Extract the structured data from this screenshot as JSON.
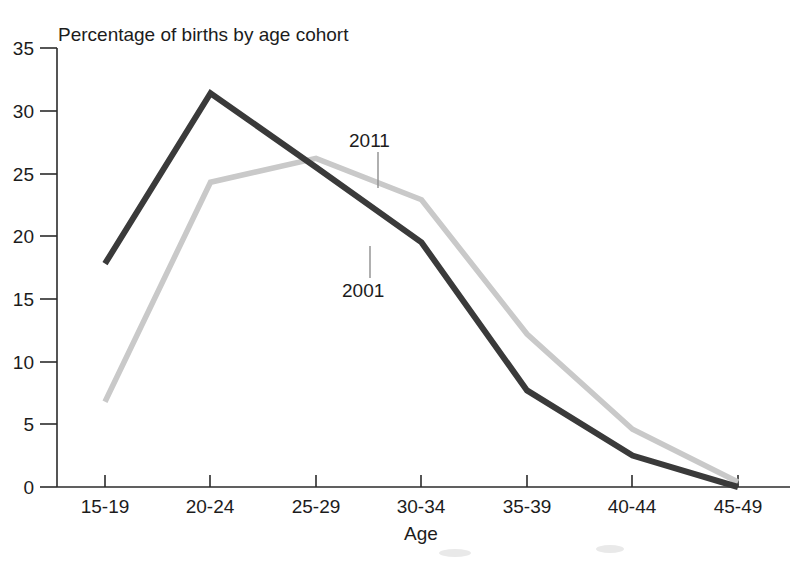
{
  "chart_data": {
    "type": "line",
    "title": "Percentage of births by age cohort",
    "xlabel": "Age",
    "ylabel": "",
    "categories": [
      "15-19",
      "20-24",
      "25-29",
      "30-34",
      "35-39",
      "40-44",
      "45-49"
    ],
    "ylim": [
      0,
      35
    ],
    "yticks": [
      0,
      5,
      10,
      15,
      20,
      25,
      30,
      35
    ],
    "ytick_labels": [
      "0",
      "5",
      "10",
      "15",
      "20",
      "25",
      "30",
      "35"
    ],
    "grid": false,
    "legend_position": "inline-annotations",
    "series": [
      {
        "name": "2001",
        "color": "#3a3a3a",
        "values": [
          17.8,
          31.4,
          25.5,
          19.5,
          7.7,
          2.5,
          0.0
        ]
      },
      {
        "name": "2011",
        "color": "#c9c9c9",
        "values": [
          6.8,
          24.3,
          26.2,
          22.9,
          12.2,
          4.6,
          0.4
        ]
      }
    ],
    "annotations": [
      {
        "text": "2011",
        "series": "2011"
      },
      {
        "text": "2001",
        "series": "2001"
      }
    ]
  },
  "axes": {
    "x_axis_name": "Age",
    "y_axis_name": ""
  }
}
